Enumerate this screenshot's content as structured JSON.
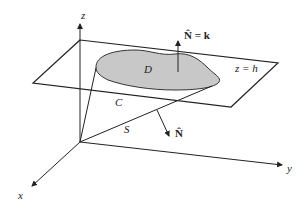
{
  "diagram": {
    "axes": {
      "x_label": "x",
      "y_label": "y",
      "z_label": "z"
    },
    "plane_label": "z = h",
    "region_label": "D",
    "curve_label": "C",
    "surface_label": "S",
    "normal_top_label": "N̂ = k",
    "normal_side_label": "N̂",
    "colors": {
      "region_fill": "#c8c8c8",
      "stroke": "#222222"
    }
  }
}
